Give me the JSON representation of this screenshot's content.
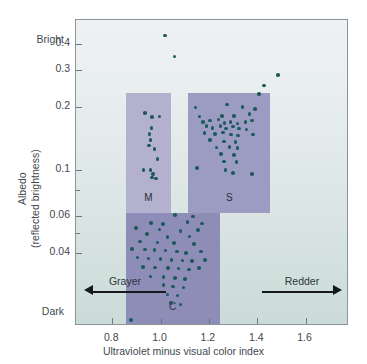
{
  "chart_data": {
    "type": "scatter",
    "title": "",
    "xlabel": "Ultraviolet minus visual color index",
    "ylabel": "Albedo",
    "ylabel2": "(reflected brightness)",
    "y_scale": "log",
    "xlim": [
      0.65,
      1.78
    ],
    "ylim": [
      0.018,
      0.52
    ],
    "grid": false,
    "xticks": [
      0.8,
      1.0,
      1.2,
      1.4,
      1.6
    ],
    "xticklabels": [
      "0.8",
      "1.0",
      "1.2",
      "1.4",
      "1.6"
    ],
    "yticks": [
      0.4,
      0.3,
      0.2,
      0.1,
      0.06,
      0.04
    ],
    "yticklabels": [
      "0.4",
      "0.3",
      "0.2",
      "0.1",
      "0.06",
      "0.04"
    ],
    "y_minor_ticks": [
      0.08,
      0.05
    ],
    "y_axis_top_label": "Bright",
    "y_axis_bottom_label": "Dark",
    "annotations": [
      {
        "name": "grayer",
        "text": "Grayer",
        "direction": "left"
      },
      {
        "name": "redder",
        "text": "Redder",
        "direction": "right"
      }
    ],
    "regions": [
      {
        "label": "M",
        "x_range": [
          0.855,
          1.045
        ],
        "y_range": [
          0.062,
          0.232
        ],
        "color": "#b3b1cd"
      },
      {
        "label": "S",
        "x_range": [
          1.115,
          1.455
        ],
        "y_range": [
          0.062,
          0.232
        ],
        "color": "#9c9bc2"
      },
      {
        "label": "C",
        "x_range": [
          0.855,
          1.245
        ],
        "y_range": [
          0.018,
          0.062
        ],
        "color": "#8e8db8"
      }
    ],
    "point_color": "#1d5a5c",
    "series": [
      {
        "name": "M-type asteroids",
        "points": [
          [
            0.935,
            0.187
          ],
          [
            0.965,
            0.179
          ],
          [
            0.995,
            0.18
          ],
          [
            0.962,
            0.159
          ],
          [
            0.955,
            0.149
          ],
          [
            0.958,
            0.139
          ],
          [
            0.952,
            0.131
          ],
          [
            0.975,
            0.126
          ],
          [
            0.988,
            0.113
          ],
          [
            0.93,
            0.1
          ],
          [
            0.958,
            0.1
          ],
          [
            0.968,
            0.096
          ],
          [
            0.965,
            0.092
          ],
          [
            0.98,
            0.091
          ]
        ]
      },
      {
        "name": "S-type asteroids",
        "points": [
          [
            1.145,
            0.199
          ],
          [
            1.275,
            0.205
          ],
          [
            1.34,
            0.2
          ],
          [
            1.39,
            0.196
          ],
          [
            1.162,
            0.18
          ],
          [
            1.255,
            0.181
          ],
          [
            1.305,
            0.181
          ],
          [
            1.368,
            0.185
          ],
          [
            1.175,
            0.17
          ],
          [
            1.205,
            0.172
          ],
          [
            1.24,
            0.174
          ],
          [
            1.265,
            0.168
          ],
          [
            1.29,
            0.17
          ],
          [
            1.318,
            0.167
          ],
          [
            1.352,
            0.17
          ],
          [
            1.378,
            0.172
          ],
          [
            1.19,
            0.162
          ],
          [
            1.215,
            0.159
          ],
          [
            1.248,
            0.162
          ],
          [
            1.272,
            0.158
          ],
          [
            1.3,
            0.161
          ],
          [
            1.325,
            0.158
          ],
          [
            1.355,
            0.156
          ],
          [
            1.182,
            0.15
          ],
          [
            1.225,
            0.149
          ],
          [
            1.258,
            0.151
          ],
          [
            1.292,
            0.148
          ],
          [
            1.32,
            0.146
          ],
          [
            1.382,
            0.148
          ],
          [
            1.205,
            0.139
          ],
          [
            1.262,
            0.137
          ],
          [
            1.31,
            0.136
          ],
          [
            1.232,
            0.128
          ],
          [
            1.285,
            0.129
          ],
          [
            1.318,
            0.127
          ],
          [
            1.25,
            0.119
          ],
          [
            1.305,
            0.118
          ],
          [
            1.262,
            0.11
          ],
          [
            1.315,
            0.109
          ],
          [
            1.152,
            0.102
          ],
          [
            1.268,
            0.1
          ],
          [
            1.3,
            0.097
          ],
          [
            1.378,
            0.096
          ]
        ]
      },
      {
        "name": "C-type asteroids",
        "points": [
          [
            1.06,
            0.061
          ],
          [
            1.135,
            0.06
          ],
          [
            0.96,
            0.056
          ],
          [
            1.01,
            0.0552
          ],
          [
            1.112,
            0.0565
          ],
          [
            1.172,
            0.0555
          ],
          [
            0.898,
            0.053
          ],
          [
            0.995,
            0.052
          ],
          [
            1.082,
            0.0512
          ],
          [
            1.155,
            0.0518
          ],
          [
            0.945,
            0.0495
          ],
          [
            1.028,
            0.048
          ],
          [
            1.12,
            0.0482
          ],
          [
            0.915,
            0.0455
          ],
          [
            0.988,
            0.045
          ],
          [
            1.055,
            0.0448
          ],
          [
            1.138,
            0.0442
          ],
          [
            0.882,
            0.042
          ],
          [
            0.935,
            0.0418
          ],
          [
            0.975,
            0.0415
          ],
          [
            1.02,
            0.0412
          ],
          [
            1.068,
            0.0408
          ],
          [
            1.105,
            0.0402
          ],
          [
            1.168,
            0.0408
          ],
          [
            0.905,
            0.0382
          ],
          [
            0.95,
            0.0378
          ],
          [
            1.0,
            0.0375
          ],
          [
            1.045,
            0.0372
          ],
          [
            1.09,
            0.037
          ],
          [
            1.13,
            0.0368
          ],
          [
            1.185,
            0.0372
          ],
          [
            0.928,
            0.0345
          ],
          [
            0.978,
            0.0342
          ],
          [
            1.032,
            0.034
          ],
          [
            1.075,
            0.0338
          ],
          [
            1.118,
            0.0335
          ],
          [
            1.158,
            0.034
          ],
          [
            0.958,
            0.031
          ],
          [
            1.012,
            0.0308
          ],
          [
            1.06,
            0.0305
          ],
          [
            1.102,
            0.0302
          ],
          [
            1.012,
            0.0282
          ],
          [
            1.052,
            0.0278
          ],
          [
            1.095,
            0.0275
          ],
          [
            1.028,
            0.0255
          ],
          [
            1.07,
            0.0252
          ],
          [
            1.042,
            0.0232
          ],
          [
            1.082,
            0.0228
          ],
          [
            0.878,
            0.0192
          ]
        ]
      },
      {
        "name": "Outliers",
        "points": [
          [
            1.018,
            0.438
          ],
          [
            1.058,
            0.348
          ],
          [
            1.485,
            0.284
          ],
          [
            1.428,
            0.253
          ],
          [
            1.408,
            0.231
          ]
        ]
      }
    ]
  }
}
